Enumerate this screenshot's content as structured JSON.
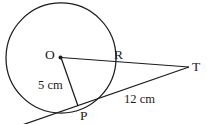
{
  "diagram": {
    "type": "geometry-circle-tangent",
    "labels": {
      "center": "O",
      "point_r": "R",
      "point_t": "T",
      "point_p": "P"
    },
    "measurements": {
      "radius_op": "5 cm",
      "tangent_pt": "12 cm"
    },
    "colors": {
      "stroke": "#1c1c1c",
      "background": "#ffffff"
    }
  }
}
